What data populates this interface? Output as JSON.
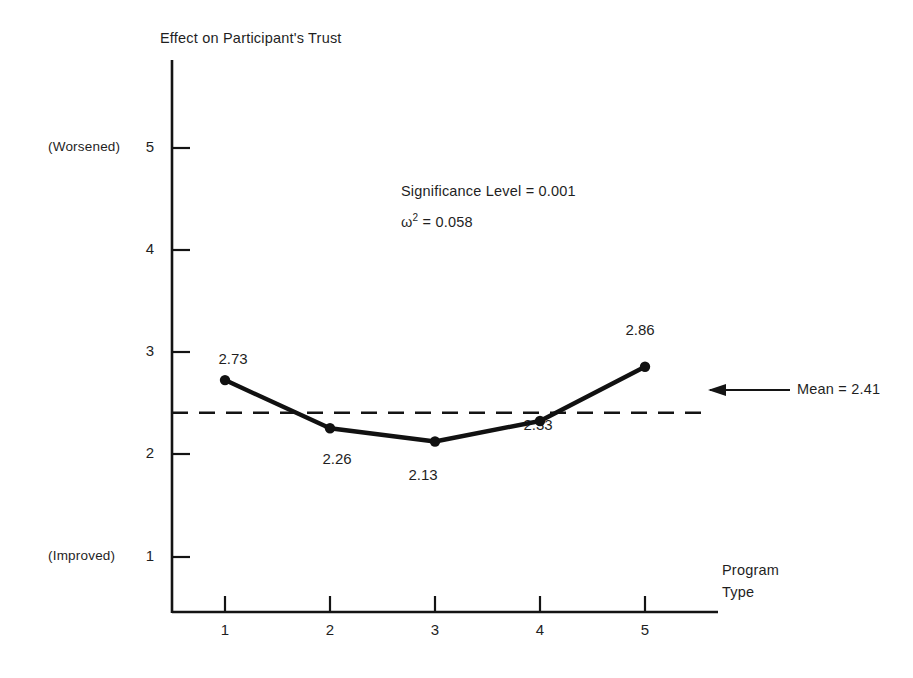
{
  "chart_data": {
    "type": "line",
    "title": "Effect on Participant's Trust",
    "xlabel_line1": "Program",
    "xlabel_line2": "Type",
    "ylabel": "",
    "categories": [
      "1",
      "2",
      "3",
      "4",
      "5"
    ],
    "x": [
      1,
      2,
      3,
      4,
      5
    ],
    "values": [
      2.73,
      2.26,
      2.13,
      2.33,
      2.86
    ],
    "point_labels": [
      "2.73",
      "2.26",
      "2.13",
      "2.33",
      "2.86"
    ],
    "xlim": [
      0.5,
      5.7
    ],
    "ylim": [
      0.5,
      5.6
    ],
    "xticks": [
      "1",
      "2",
      "3",
      "4",
      "5"
    ],
    "yticks": [
      "1",
      "2",
      "3",
      "4",
      "5"
    ],
    "grid": false,
    "legend": "none",
    "mean_value": 2.41,
    "mean_label": "Mean = 2.41",
    "axis_note_high": "(Worsened)",
    "axis_note_low": "(Improved)",
    "annotations": [
      "Significance Level = 0.001"
    ],
    "omega_symbol": "ω",
    "omega_exponent": "2",
    "omega_value": "= 0.058",
    "colors": {
      "ink": "#1a1a1a",
      "background": "#ffffff",
      "series": "#111111",
      "mean_line": "#111111"
    }
  }
}
